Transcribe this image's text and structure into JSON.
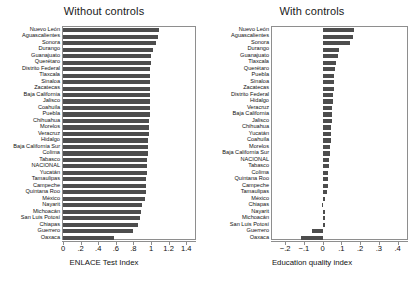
{
  "figure": {
    "panels": [
      {
        "key": "without",
        "title": "Without controls",
        "axis_title": "ENLACE Test Index"
      },
      {
        "key": "with",
        "title": "With controls",
        "axis_title": "Education quality index"
      }
    ]
  },
  "chart_data": [
    {
      "type": "bar",
      "orientation": "horizontal",
      "title": "Without controls",
      "xlabel": "ENLACE Test Index",
      "ylabel": "",
      "xlim": [
        0,
        1.5
      ],
      "xticks": [
        0,
        0.2,
        0.4,
        0.6,
        0.8,
        1,
        1.2,
        1.4
      ],
      "xticklabels": [
        "0",
        ".2",
        ".4",
        ".6",
        ".8",
        "1",
        "1.2",
        "1.4"
      ],
      "grid": false,
      "legend": "none",
      "bar_color": "#4d4d4d",
      "categories": [
        "Nuevo León",
        "Aguascalientes",
        "Sonora",
        "Durango",
        "Guanajuato",
        "Querétaro",
        "Distrito Federal",
        "Tlaxcala",
        "Sinaloa",
        "Zacatecas",
        "Baja California",
        "Jalisco",
        "Coahuila",
        "Puebla",
        "Chihuahua",
        "Morelos",
        "Veracruz",
        "Hidalgo",
        "Baja California Sur",
        "Colima",
        "Tabasco",
        "NACIONAL",
        "Yucatán",
        "Tamaulipas",
        "Campeche",
        "Quintana Roo",
        "México",
        "Nayarit",
        "Michoacán",
        "San Luis Potosí",
        "Chiapas",
        "Guerrero",
        "Oaxaca"
      ],
      "values": [
        1.09,
        1.08,
        1.06,
        1.02,
        1.0,
        1.0,
        0.99,
        0.99,
        0.99,
        0.99,
        0.99,
        0.99,
        0.99,
        0.99,
        0.98,
        0.98,
        0.98,
        0.97,
        0.97,
        0.97,
        0.96,
        0.95,
        0.95,
        0.94,
        0.94,
        0.94,
        0.93,
        0.9,
        0.89,
        0.88,
        0.85,
        0.8,
        0.58
      ]
    },
    {
      "type": "bar",
      "orientation": "horizontal",
      "title": "With controls",
      "xlabel": "Education quality index",
      "ylabel": "",
      "xlim": [
        -0.27,
        0.45
      ],
      "xticks": [
        -0.2,
        -0.1,
        0,
        0.1,
        0.2,
        0.3,
        0.4
      ],
      "xticklabels": [
        "−.2",
        "−.1",
        "0",
        ".1",
        ".2",
        ".3",
        ".4"
      ],
      "grid": false,
      "legend": "none",
      "bar_color": "#4d4d4d",
      "categories": [
        "Nuevo León",
        "Aguascalientes",
        "Sonora",
        "Durango",
        "Guanajuato",
        "Tlaxcala",
        "Querétaro",
        "Puebla",
        "Sinaloa",
        "Zacatecas",
        "Distrito Federal",
        "Hidalgo",
        "Veracruz",
        "Baja California",
        "Jalisco",
        "Chihuahua",
        "Yucatán",
        "Coahuila",
        "Morelos",
        "Baja California Sur",
        "NACIONAL",
        "Tabasco",
        "Colima",
        "Quintana Roo",
        "Campeche",
        "Tamaulipas",
        "México",
        "Chiapas",
        "Nayarit",
        "Michoacán",
        "San Luis Potosí",
        "Guerrero",
        "Oaxaca"
      ],
      "values": [
        0.166,
        0.162,
        0.148,
        0.086,
        0.082,
        0.069,
        0.066,
        0.063,
        0.06,
        0.058,
        0.056,
        0.054,
        0.052,
        0.05,
        0.048,
        0.046,
        0.044,
        0.042,
        0.04,
        0.038,
        0.036,
        0.032,
        0.03,
        0.028,
        0.026,
        0.022,
        0.012,
        -0.004,
        0.01,
        0.012,
        0.014,
        -0.058,
        -0.118
      ]
    }
  ]
}
